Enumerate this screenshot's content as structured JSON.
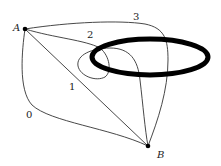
{
  "diagram": {
    "type": "graph-paths",
    "vertices": [
      {
        "id": "A",
        "label": "A",
        "x": 25,
        "y": 29
      },
      {
        "id": "B",
        "label": "B",
        "x": 148,
        "y": 146
      }
    ],
    "paths": [
      {
        "id": "0",
        "label": "0"
      },
      {
        "id": "1",
        "label": "1"
      },
      {
        "id": "2",
        "label": "2"
      },
      {
        "id": "3",
        "label": "3"
      }
    ],
    "obstacle": {
      "shape": "ellipse",
      "cx": 150,
      "cy": 57,
      "rx": 58,
      "ry": 18,
      "stroke_width": 5,
      "color": "#000000"
    },
    "colors": {
      "curve": "#333333",
      "vertex": "#000000",
      "ellipse": "#000000"
    }
  }
}
